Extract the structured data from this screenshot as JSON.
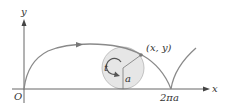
{
  "diagram": {
    "type": "cycloid",
    "axes": {
      "x_label": "x",
      "y_label": "y",
      "origin_label": "O"
    },
    "labels": {
      "point": "(x, y)",
      "angle": "t",
      "radius": "a",
      "period_tick": "2πa"
    },
    "colors": {
      "curve": "#8a8a8a",
      "axis": "#555555",
      "circle_fill": "#e6e6e6",
      "circle_stroke": "#b5b5b5",
      "point": "#7a7a7a",
      "text": "#333333"
    }
  }
}
